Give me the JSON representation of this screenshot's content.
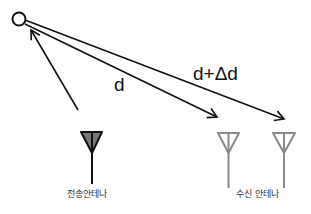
{
  "diagram": {
    "title": "",
    "nodes": [
      {
        "id": "source",
        "kind": "point-circle",
        "label": ""
      },
      {
        "id": "tx_antenna",
        "kind": "antenna",
        "label": "전송안테나",
        "style": "filled-gray"
      },
      {
        "id": "rx_antenna_1",
        "kind": "antenna",
        "label": "",
        "style": "outline-gray"
      },
      {
        "id": "rx_antenna_2",
        "kind": "antenna",
        "label": "",
        "style": "outline-gray"
      }
    ],
    "edges": [
      {
        "from": "tx_antenna",
        "to": "source",
        "label": ""
      },
      {
        "from": "source",
        "to": "rx_antenna_1",
        "label": "d"
      },
      {
        "from": "source",
        "to": "rx_antenna_2",
        "label": "d+Δd"
      }
    ],
    "labels": {
      "d": "d",
      "d_plus_delta": "d+Δd",
      "tx": "전송안테나",
      "rx": "수신 안테나"
    },
    "colors": {
      "line": "#111111",
      "tx_fill": "#777777",
      "rx_stroke": "#8a8a8a"
    }
  }
}
